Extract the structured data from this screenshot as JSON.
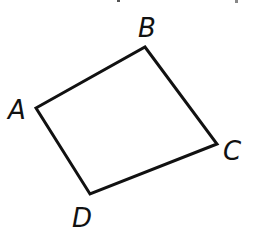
{
  "figure": {
    "type": "quadrilateral",
    "stroke_color": "#111111",
    "background": "#ffffff",
    "vertices": [
      {
        "label": "A",
        "x": 36,
        "y": 108
      },
      {
        "label": "B",
        "x": 145,
        "y": 47
      },
      {
        "label": "C",
        "x": 217,
        "y": 144
      },
      {
        "label": "D",
        "x": 90,
        "y": 194
      }
    ],
    "labels": {
      "A": "A",
      "B": "B",
      "C": "C",
      "D": "D"
    }
  }
}
